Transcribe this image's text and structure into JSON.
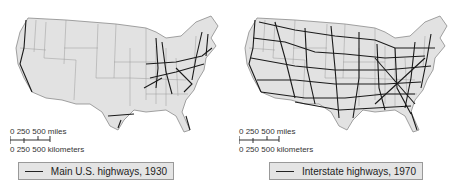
{
  "maps": [
    {
      "id": "left",
      "title": "Main U.S. highways, 1930",
      "legend_label": "Main U.S. highways, 1930",
      "scale": {
        "miles_label": "0   250   500 miles",
        "km_label": "0  250  500 kilometers"
      }
    },
    {
      "id": "right",
      "title": "Interstate highways, 1970",
      "legend_label": "Interstate highways, 1970",
      "scale": {
        "miles_label": "0   250   500 miles",
        "km_label": "0  250  500 kilometers"
      }
    }
  ],
  "colors": {
    "land": "#e2e2e2",
    "border": "#8a8a8a",
    "highway": "#1a1a1a",
    "legend_bg": "#e4e4e4"
  }
}
